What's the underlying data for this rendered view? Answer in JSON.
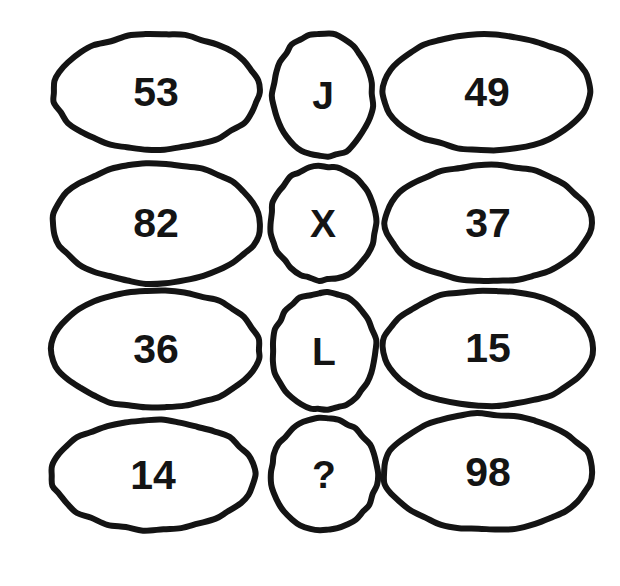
{
  "canvas": {
    "width": 620,
    "height": 586,
    "background_color": "#ffffff",
    "stroke_color": "#141414",
    "text_color": "#141414",
    "stroke_width": 6
  },
  "puzzle": {
    "type": "ellipse-grid-sequence-puzzle",
    "rows": 4,
    "columns": 3,
    "missing_marker": "?"
  },
  "grid": {
    "rows": [
      {
        "row_index": 0,
        "cells": [
          {
            "id": "r0c0",
            "text": "53",
            "kind": "number",
            "shape": "wide-ellipse",
            "cx": 156,
            "cy": 92,
            "rx": 103,
            "ry": 58
          },
          {
            "id": "r0c1",
            "text": "J",
            "kind": "letter",
            "shape": "narrow-ellipse",
            "cx": 323,
            "cy": 95,
            "rx": 50,
            "ry": 62
          },
          {
            "id": "r0c2",
            "text": "49",
            "kind": "number",
            "shape": "wide-ellipse",
            "cx": 487,
            "cy": 92,
            "rx": 104,
            "ry": 58
          }
        ]
      },
      {
        "row_index": 1,
        "cells": [
          {
            "id": "r1c0",
            "text": "82",
            "kind": "number",
            "shape": "wide-ellipse",
            "cx": 156,
            "cy": 223,
            "rx": 104,
            "ry": 60
          },
          {
            "id": "r1c1",
            "text": "X",
            "kind": "letter",
            "shape": "narrow-ellipse",
            "cx": 323,
            "cy": 223,
            "rx": 53,
            "ry": 57
          },
          {
            "id": "r1c2",
            "text": "37",
            "kind": "number",
            "shape": "wide-ellipse",
            "cx": 488,
            "cy": 223,
            "rx": 103,
            "ry": 58
          }
        ]
      },
      {
        "row_index": 2,
        "cells": [
          {
            "id": "r2c0",
            "text": "36",
            "kind": "number",
            "shape": "wide-ellipse",
            "cx": 156,
            "cy": 349,
            "rx": 104,
            "ry": 59
          },
          {
            "id": "r2c1",
            "text": "L",
            "kind": "letter",
            "shape": "narrow-ellipse",
            "cx": 324,
            "cy": 351,
            "rx": 52,
            "ry": 59
          },
          {
            "id": "r2c2",
            "text": "15",
            "kind": "number",
            "shape": "wide-ellipse",
            "cx": 488,
            "cy": 348,
            "rx": 105,
            "ry": 58
          }
        ]
      },
      {
        "row_index": 3,
        "cells": [
          {
            "id": "r3c0",
            "text": "14",
            "kind": "number",
            "shape": "wide-ellipse",
            "cx": 153,
            "cy": 475,
            "rx": 102,
            "ry": 55
          },
          {
            "id": "r3c1",
            "text": "?",
            "kind": "marker",
            "shape": "narrow-ellipse",
            "cx": 324,
            "cy": 474,
            "rx": 53,
            "ry": 56
          },
          {
            "id": "r3c2",
            "text": "98",
            "kind": "number",
            "shape": "wide-ellipse",
            "cx": 488,
            "cy": 472,
            "rx": 105,
            "ry": 58
          }
        ]
      }
    ]
  }
}
